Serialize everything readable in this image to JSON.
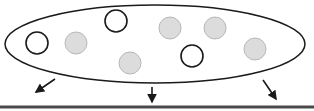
{
  "diagram": {
    "width": 314,
    "height": 111,
    "colors": {
      "stroke": "#1a1a1a",
      "filled_circle": "#dcdcdc",
      "filled_circle_stroke": "#b8b8b8",
      "baseline": "#4a4a4a"
    },
    "ellipse": {
      "cx": 155,
      "cy": 44,
      "rx": 150,
      "ry": 39
    },
    "circles": [
      {
        "id": "open-1",
        "cx": 37,
        "cy": 43,
        "r": 11,
        "type": "open"
      },
      {
        "id": "filled-1",
        "cx": 76,
        "cy": 43,
        "r": 11,
        "type": "filled"
      },
      {
        "id": "open-2",
        "cx": 116,
        "cy": 21,
        "r": 11,
        "type": "open"
      },
      {
        "id": "filled-2",
        "cx": 130,
        "cy": 63,
        "r": 11,
        "type": "filled"
      },
      {
        "id": "filled-3",
        "cx": 170,
        "cy": 28,
        "r": 11,
        "type": "filled"
      },
      {
        "id": "filled-4",
        "cx": 215,
        "cy": 28,
        "r": 11,
        "type": "filled"
      },
      {
        "id": "open-3",
        "cx": 192,
        "cy": 56,
        "r": 11,
        "type": "open"
      },
      {
        "id": "filled-5",
        "cx": 255,
        "cy": 49,
        "r": 11,
        "type": "filled"
      }
    ],
    "arrows": [
      {
        "id": "arrow-left",
        "x1": 55,
        "y1": 79,
        "x2": 36,
        "y2": 92
      },
      {
        "id": "arrow-middle",
        "x1": 152,
        "y1": 87,
        "x2": 152,
        "y2": 102
      },
      {
        "id": "arrow-right",
        "x1": 263,
        "y1": 80,
        "x2": 276,
        "y2": 99
      }
    ],
    "baseline": {
      "x1": 0,
      "y1": 107,
      "x2": 314,
      "y2": 107,
      "width": 3
    }
  }
}
